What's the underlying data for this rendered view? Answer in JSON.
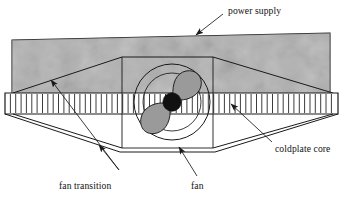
{
  "figure": {
    "kind": "technical-line-drawing",
    "background_color": "#ffffff",
    "line_color": "#1a1a1a"
  },
  "labels": {
    "power_supply": "power supply",
    "coldplate_core": "coldplate core",
    "fan_transition": "fan transition",
    "fan": "fan"
  },
  "components": {
    "power_supply": {
      "name": "power supply",
      "fill": "#a8a8a8",
      "texture": "mottled-speckled-gray",
      "shape": "rectangle"
    },
    "coldplate_core": {
      "name": "coldplate core",
      "fill": "#ffffff",
      "shape": "finned-band",
      "fin_count": 62
    },
    "fan_transition_upper": {
      "name": "fan transition",
      "shape": "trapezoid",
      "fill": "none"
    },
    "fan_transition_lower": {
      "name": "fan transition",
      "shape": "trapezoid",
      "fill": "none"
    },
    "fan": {
      "name": "fan",
      "shape": "circle-with-blades",
      "blade_count": 2,
      "blade_fill": "#9a9a9a",
      "hub_fill": "#111111"
    }
  },
  "geometry": {
    "power_supply_rect": {
      "x1": 12,
      "y1": 40,
      "x2": 330,
      "y2": 95
    },
    "fin_band": {
      "x1": 5,
      "y1": 93,
      "x2": 338,
      "y2": 114,
      "fins": 62
    },
    "fan_center": {
      "cx": 172,
      "cy": 102
    },
    "fan_outer_radius": 38,
    "fan_inner_radius": 29,
    "fan_hub_radius": 9,
    "fan_housing_rect": {
      "x1": 122,
      "y1": 57,
      "x2": 213,
      "y2": 148
    }
  },
  "leaders": {
    "power_supply": {
      "from_x": 223,
      "from_y": 16,
      "to_x": 194,
      "to_y": 36
    },
    "coldplate_core": {
      "from_x": 272,
      "from_y": 146,
      "to_x": 229,
      "to_y": 103
    },
    "fan": {
      "from_x": 196,
      "from_y": 178,
      "to_x": 178,
      "to_y": 146
    },
    "fan_transition_a": {
      "from_x": 119,
      "from_y": 172,
      "to_x": 50,
      "to_y": 79
    },
    "fan_transition_b": {
      "from_x": 119,
      "from_y": 172,
      "to_x": 99,
      "to_y": 146
    }
  }
}
